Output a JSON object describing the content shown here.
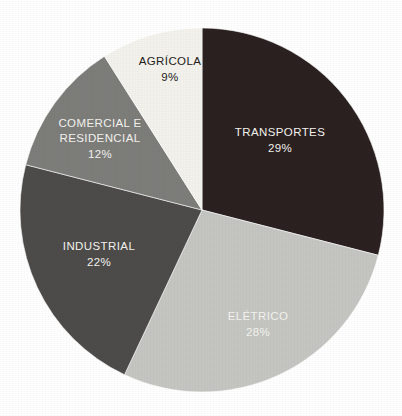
{
  "chart_data": {
    "type": "pie",
    "title": "",
    "subtitle": "",
    "xlabel": "",
    "ylabel": "",
    "grid": false,
    "legend_position": "none",
    "labels_inside_slices": true,
    "start_angle_deg": 0,
    "direction": "clockwise",
    "total_percent": 100,
    "categories": [
      "TRANSPORTES",
      "ELÉTRICO",
      "INDUSTRIAL",
      "COMERCIAL E RESIDENCIAL",
      "AGRÍCOLA"
    ],
    "values": [
      29,
      28,
      22,
      12,
      9
    ],
    "slices": [
      {
        "name": "TRANSPORTES",
        "value": 29,
        "value_label": "29%",
        "color": "#2b2120",
        "text_color": "#f4f3ef",
        "start_deg": 0,
        "end_deg": 104.4,
        "label_lines": [
          "TRANSPORTES"
        ]
      },
      {
        "name": "ELÉTRICO",
        "value": 28,
        "value_label": "28%",
        "color": "#c5c6c2",
        "text_color": "#f4f3ef",
        "start_deg": 104.4,
        "end_deg": 205.2,
        "label_lines": [
          "ELÉTRICO"
        ]
      },
      {
        "name": "INDUSTRIAL",
        "value": 22,
        "value_label": "22%",
        "color": "#4d4c4a",
        "text_color": "#f4f3ef",
        "start_deg": 205.2,
        "end_deg": 284.4,
        "label_lines": [
          "INDUSTRIAL"
        ]
      },
      {
        "name": "COMERCIAL E RESIDENCIAL",
        "value": 12,
        "value_label": "12%",
        "color": "#7d7d7a",
        "text_color": "#f4f3ef",
        "start_deg": 284.4,
        "end_deg": 327.6,
        "label_lines": [
          "COMERCIAL E",
          "RESIDENCIAL"
        ]
      },
      {
        "name": "AGRÍCOLA",
        "value": 9,
        "value_label": "9%",
        "color": "#f3f2ec",
        "text_color": "#262220",
        "start_deg": 327.6,
        "end_deg": 360,
        "label_lines": [
          "AGRÍCOLA"
        ]
      }
    ],
    "geometry": {
      "center_x": 202,
      "center_y": 210,
      "radius": 182
    },
    "background_color": "#ffffff"
  },
  "labels": {
    "transportes": {
      "name": "TRANSPORTES",
      "value": "29%"
    },
    "eletrico": {
      "name": "ELÉTRICO",
      "value": "28%"
    },
    "industrial": {
      "name": "INDUSTRIAL",
      "value": "22%"
    },
    "comercial_line1": "COMERCIAL E",
    "comercial_line2": "RESIDENCIAL",
    "comercial_value": "12%",
    "agricola": {
      "name": "AGRÍCOLA",
      "value": "9%"
    }
  }
}
